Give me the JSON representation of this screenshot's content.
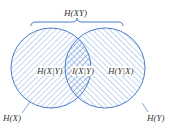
{
  "diagram": {
    "type": "venn",
    "colors": {
      "stroke": "#4a7cc9",
      "hatch": "#6f9bd8",
      "text": "#333333"
    },
    "labels": {
      "joint": "H(XY)",
      "left_only": "H(X|Y)",
      "overlap": "I(X|Y)",
      "right_only": "H(Y|X)",
      "left_circle": "H(X)",
      "right_circle": "H(Y)"
    }
  }
}
